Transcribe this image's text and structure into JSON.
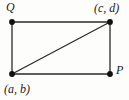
{
  "figure": {
    "type": "rectangle-with-diagonal",
    "background_color": "#fdfdfc",
    "stroke_color": "#2a2a2a",
    "vertex_color": "#111111",
    "vertices": {
      "top_left": {
        "x": 12,
        "y": 22,
        "label": "Q",
        "label_position": "above-left"
      },
      "top_right": {
        "x": 110,
        "y": 22,
        "label": "(c, d)",
        "label_position": "above-right"
      },
      "bottom_left": {
        "x": 12,
        "y": 74,
        "label": "(a, b)",
        "label_position": "below-left"
      },
      "bottom_right": {
        "x": 110,
        "y": 74,
        "label": "P",
        "label_position": "right"
      }
    },
    "edges": [
      {
        "name": "top-edge",
        "from": "top_left",
        "to": "top_right"
      },
      {
        "name": "right-edge",
        "from": "top_right",
        "to": "bottom_right"
      },
      {
        "name": "bottom-edge",
        "from": "bottom_left",
        "to": "bottom_right"
      },
      {
        "name": "left-edge",
        "from": "top_left",
        "to": "bottom_left"
      },
      {
        "name": "diagonal-edge",
        "from": "bottom_left",
        "to": "top_right"
      }
    ],
    "labels": {
      "q": "Q",
      "cd": "(c, d)",
      "ab": "(a, b)",
      "p": "P"
    }
  }
}
